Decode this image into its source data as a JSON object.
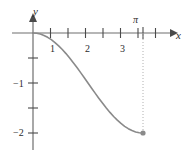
{
  "figure": {
    "background_color": "#ffffff",
    "axis_color": "#6e6e6e",
    "curve_color": "#8a8a8a",
    "text_color": "#2b2b2b",
    "guide_color": "#b0b0b0",
    "point_color": "#8a8a8a"
  },
  "axes": {
    "x_axis_label": "x",
    "y_axis_label": "y",
    "x_tick_labels": [
      "1",
      "2",
      "3"
    ],
    "y_tick_labels": [
      "−1",
      "−2"
    ],
    "pi_label": "π"
  },
  "chart_data": {
    "type": "line",
    "title": "",
    "xlabel": "x",
    "ylabel": "y",
    "xlim": [
      -0.15,
      3.65
    ],
    "ylim": [
      -2.35,
      0.3
    ],
    "grid": false,
    "legend": null,
    "x_ticks": [
      0.5,
      1,
      1.5,
      2,
      2.5,
      3,
      3.5
    ],
    "x_tick_labels_shown": {
      "1": "1",
      "2": "2",
      "3": "3"
    },
    "y_ticks": [
      -0.5,
      -1,
      -1.5,
      -2
    ],
    "y_tick_labels_shown": {
      "-1": "−1",
      "-2": "−2"
    },
    "function": "y = cos(x) - 1",
    "domain": [
      0,
      3.14159265
    ],
    "annotations": [
      {
        "text": "π",
        "x": 3.14159265,
        "y": 0.18,
        "kind": "axis-tick-label"
      }
    ],
    "guides": [
      {
        "kind": "dotted-vertical",
        "x": 3.14159265,
        "y_from": 0,
        "y_to": -2
      }
    ],
    "markers": [
      {
        "kind": "filled-dot",
        "x": 3.14159265,
        "y": -2
      }
    ],
    "x": [
      0,
      0.1047,
      0.2094,
      0.3142,
      0.4189,
      0.5236,
      0.6283,
      0.733,
      0.8378,
      0.9425,
      1.0472,
      1.1519,
      1.2566,
      1.3614,
      1.4661,
      1.5708,
      1.6755,
      1.7802,
      1.885,
      1.9897,
      2.0944,
      2.1991,
      2.3038,
      2.4086,
      2.5133,
      2.618,
      2.7227,
      2.8274,
      2.9322,
      3.0369,
      3.1416
    ],
    "y": [
      0,
      -0.0055,
      -0.0219,
      -0.0489,
      -0.0865,
      -0.134,
      -0.191,
      -0.2569,
      -0.3309,
      -0.4122,
      -0.5,
      -0.5933,
      -0.691,
      -0.7921,
      -0.8955,
      -1.0,
      -1.1045,
      -1.2079,
      -1.309,
      -1.4067,
      -1.5,
      -1.5878,
      -1.6691,
      -1.7431,
      -1.809,
      -1.866,
      -1.9135,
      -1.9511,
      -1.9781,
      -1.9945,
      -2.0
    ]
  }
}
